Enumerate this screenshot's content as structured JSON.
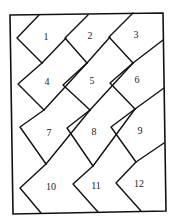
{
  "diagram": {
    "type": "tiling-puzzle",
    "stroke_color": "#111111",
    "background": "#ffffff",
    "frame": [
      [
        10,
        15
      ],
      [
        163,
        13
      ],
      [
        166,
        211
      ],
      [
        13,
        214
      ]
    ],
    "tiles": [
      {
        "id": 1,
        "label": "1",
        "x": 46,
        "y": 38
      },
      {
        "id": 2,
        "label": "2",
        "x": 90,
        "y": 37
      },
      {
        "id": 3,
        "label": "3",
        "x": 136,
        "y": 36
      },
      {
        "id": 4,
        "label": "4",
        "x": 47,
        "y": 83
      },
      {
        "id": 5,
        "label": "5",
        "x": 92,
        "y": 82
      },
      {
        "id": 6,
        "label": "6",
        "x": 137,
        "y": 81
      },
      {
        "id": 7,
        "label": "7",
        "x": 49,
        "y": 134
      },
      {
        "id": 8,
        "label": "8",
        "x": 94,
        "y": 133
      },
      {
        "id": 9,
        "label": "9",
        "x": 140,
        "y": 132
      },
      {
        "id": 10,
        "label": "10",
        "x": 51,
        "y": 188
      },
      {
        "id": 11,
        "label": "11",
        "x": 96,
        "y": 187
      },
      {
        "id": 12,
        "label": "12",
        "x": 139,
        "y": 185
      }
    ],
    "lines": [
      [
        [
          39,
          15
        ],
        [
          17,
          38
        ],
        [
          42,
          63
        ]
      ],
      [
        [
          88,
          15
        ],
        [
          65,
          38
        ],
        [
          87,
          63
        ]
      ],
      [
        [
          133,
          13
        ],
        [
          109,
          37
        ],
        [
          133,
          63
        ]
      ],
      [
        [
          42,
          63
        ],
        [
          66,
          38
        ]
      ],
      [
        [
          87,
          63
        ],
        [
          110,
          37
        ]
      ],
      [
        [
          133,
          63
        ],
        [
          163,
          40
        ]
      ],
      [
        [
          42,
          63
        ],
        [
          18,
          84
        ],
        [
          44,
          110
        ]
      ],
      [
        [
          87,
          63
        ],
        [
          63,
          85
        ],
        [
          90,
          110
        ]
      ],
      [
        [
          133,
          63
        ],
        [
          110,
          83
        ],
        [
          135,
          109
        ]
      ],
      [
        [
          44,
          110
        ],
        [
          87,
          63
        ]
      ],
      [
        [
          90,
          110
        ],
        [
          133,
          63
        ]
      ],
      [
        [
          135,
          109
        ],
        [
          164,
          88
        ]
      ],
      [
        [
          44,
          110
        ],
        [
          20,
          127
        ],
        [
          46,
          164
        ]
      ],
      [
        [
          90,
          110
        ],
        [
          67,
          128
        ],
        [
          93,
          166
        ]
      ],
      [
        [
          135,
          109
        ],
        [
          111,
          127
        ],
        [
          136,
          162
        ]
      ],
      [
        [
          46,
          164
        ],
        [
          90,
          110
        ]
      ],
      [
        [
          93,
          166
        ],
        [
          135,
          109
        ]
      ],
      [
        [
          136,
          162
        ],
        [
          164,
          143
        ]
      ],
      [
        [
          46,
          164
        ],
        [
          20,
          188
        ],
        [
          41,
          213
        ]
      ],
      [
        [
          93,
          166
        ],
        [
          73,
          184
        ],
        [
          98,
          212
        ]
      ],
      [
        [
          136,
          162
        ],
        [
          116,
          183
        ],
        [
          141,
          211
        ]
      ]
    ]
  }
}
